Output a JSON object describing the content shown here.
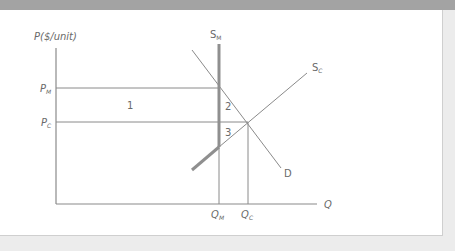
{
  "diagram": {
    "y_axis_label": "P($/unit)",
    "x_axis_label": "Q",
    "price_labels": {
      "monopoly": {
        "main": "P",
        "sub": "M"
      },
      "competitive": {
        "main": "P",
        "sub": "C"
      }
    },
    "quantity_labels": {
      "monopoly": {
        "main": "Q",
        "sub": "M"
      },
      "competitive": {
        "main": "Q",
        "sub": "C"
      }
    },
    "curves": {
      "monopoly_supply": {
        "main": "S",
        "sub": "M"
      },
      "competitive_supply": {
        "main": "S",
        "sub": "C"
      },
      "demand": "D"
    },
    "regions": [
      "1",
      "2",
      "3"
    ],
    "colors": {
      "axis": "#8a8a8a",
      "line": "#8a8a8a",
      "thick_line": "#8f8f8f",
      "text": "#6a6a6a",
      "frame_band": "#a3a3a3",
      "frame_light": "#ececec"
    }
  }
}
